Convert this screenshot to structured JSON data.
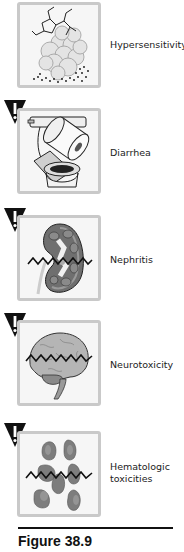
{
  "figure": {
    "items": [
      {
        "label": "Hypersensitivity",
        "icon": "immune-cell-with-molecule-icon"
      },
      {
        "label": "Diarrhea",
        "icon": "toilet-with-paper-roll-icon"
      },
      {
        "label": "Nephritis",
        "icon": "kidney-icon"
      },
      {
        "label": "Neurotoxicity",
        "icon": "brain-icon"
      },
      {
        "label": "Hematologic toxicities",
        "icon": "blood-cells-icon"
      }
    ],
    "warning_symbol": "!",
    "caption": "Figure 38.9"
  }
}
